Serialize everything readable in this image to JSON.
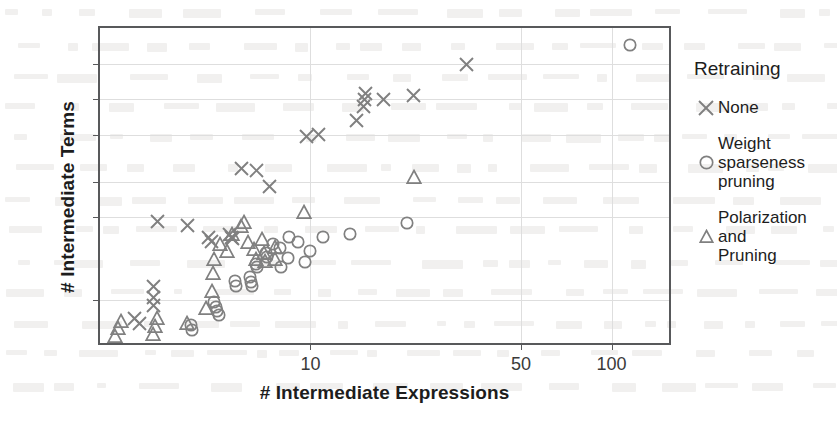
{
  "chart_data": {
    "type": "scatter",
    "title": "",
    "xlabel": "# Intermediate Expressions",
    "ylabel": "# Intermediate Terms",
    "xscale": "log",
    "yscale": "log",
    "xlim": [
      2.0,
      160.0
    ],
    "ylim": [
      4.0,
      2000.0
    ],
    "xticks": [
      10,
      50,
      100
    ],
    "xticklabels": [
      "10",
      "50",
      "100"
    ],
    "yticks": [
      10,
      50,
      100,
      250,
      500,
      1000
    ],
    "yticklabels": [
      "10",
      "50",
      "100",
      "250",
      "500",
      "1000"
    ],
    "grid": true,
    "legend_position": "right",
    "legend_title": "Retraining",
    "marker_color": "#808080",
    "frame_color": "#58595b",
    "grid_color": "#dedede",
    "series": [
      {
        "name": "None",
        "marker": "x",
        "points": [
          [
            2.6,
            7.0
          ],
          [
            2.7,
            6.3
          ],
          [
            3.0,
            13.0
          ],
          [
            3.0,
            10.5
          ],
          [
            3.0,
            9.0
          ],
          [
            3.1,
            46.0
          ],
          [
            3.9,
            43.0
          ],
          [
            4.6,
            34.0
          ],
          [
            4.7,
            31.0
          ],
          [
            5.4,
            36.0
          ],
          [
            5.45,
            34.0
          ],
          [
            5.5,
            33.0
          ],
          [
            5.9,
            130.0
          ],
          [
            6.6,
            125.0
          ],
          [
            7.3,
            92.0
          ],
          [
            9.7,
            240.0
          ],
          [
            10.6,
            252.0
          ],
          [
            14.2,
            330.0
          ],
          [
            15.0,
            430.0
          ],
          [
            15.1,
            500.0
          ],
          [
            15.2,
            560.0
          ],
          [
            17.5,
            500.0
          ],
          [
            22.0,
            540.0
          ],
          [
            33.0,
            980.0
          ]
        ]
      },
      {
        "name": "Weight\nsparseness\npruning",
        "marker": "o",
        "points": [
          [
            4.0,
            6.2
          ],
          [
            4.05,
            5.6
          ],
          [
            4.8,
            9.6
          ],
          [
            4.85,
            8.8
          ],
          [
            4.9,
            8.1
          ],
          [
            4.95,
            7.5
          ],
          [
            5.6,
            14.5
          ],
          [
            5.65,
            13.2
          ],
          [
            6.3,
            15.5
          ],
          [
            6.35,
            14.2
          ],
          [
            6.4,
            13.0
          ],
          [
            6.6,
            20.0
          ],
          [
            6.65,
            19.0
          ],
          [
            7.1,
            25.0
          ],
          [
            7.15,
            23.0
          ],
          [
            7.5,
            30.0
          ],
          [
            7.9,
            27.5
          ],
          [
            8.0,
            19.0
          ],
          [
            8.4,
            22.5
          ],
          [
            8.5,
            34.0
          ],
          [
            9.1,
            31.0
          ],
          [
            9.6,
            21.0
          ],
          [
            10.0,
            26.0
          ],
          [
            11.0,
            34.0
          ],
          [
            13.5,
            36.0
          ],
          [
            21.0,
            45.0
          ],
          [
            115.0,
            1450.0
          ]
        ]
      },
      {
        "name": "Polarization\nand\nPruning",
        "marker": "^",
        "points": [
          [
            2.25,
            5.0
          ],
          [
            2.3,
            5.8
          ],
          [
            2.35,
            6.6
          ],
          [
            3.0,
            5.2
          ],
          [
            3.05,
            6.0
          ],
          [
            3.1,
            7.0
          ],
          [
            3.9,
            6.4
          ],
          [
            4.5,
            8.5
          ],
          [
            4.7,
            12.0
          ],
          [
            4.75,
            17.0
          ],
          [
            4.8,
            22.0
          ],
          [
            5.0,
            30.0
          ],
          [
            5.3,
            26.0
          ],
          [
            5.5,
            36.0
          ],
          [
            5.9,
            42.0
          ],
          [
            6.0,
            46.0
          ],
          [
            6.2,
            31.0
          ],
          [
            6.5,
            27.0
          ],
          [
            6.6,
            22.0
          ],
          [
            6.9,
            33.0
          ],
          [
            7.0,
            25.0
          ],
          [
            7.05,
            21.5
          ],
          [
            7.6,
            28.0
          ],
          [
            7.65,
            22.0
          ],
          [
            9.5,
            56.0
          ],
          [
            22.0,
            110.0
          ]
        ]
      }
    ]
  },
  "axes": {
    "ylabel": "# Intermediate Terms",
    "xlabel": "# Intermediate Expressions"
  },
  "legend": {
    "title": "Retraining",
    "items": [
      {
        "label": "None",
        "marker": "x-marker"
      },
      {
        "label": "Weight\nsparseness\npruning",
        "marker": "circle-marker"
      },
      {
        "label": "Polarization\nand\nPruning",
        "marker": "triangle-marker"
      }
    ]
  }
}
